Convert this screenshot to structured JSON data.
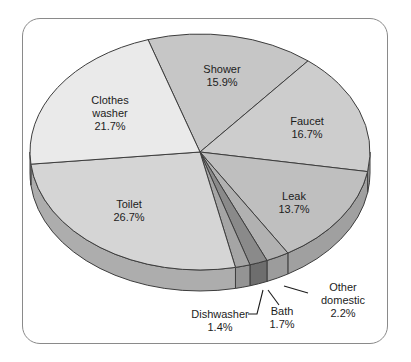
{
  "frame": {
    "background_color": "#ffffff",
    "border_color": "#8a8a8a"
  },
  "chart_data": {
    "type": "pie",
    "title": "",
    "style": "3d-pie-grayscale",
    "direction": "clockwise",
    "start_angle_deg": 107.8,
    "outline_color": "#3d3d3d",
    "label_color": "#1c1c1c",
    "categories": [
      "Shower",
      "Faucet",
      "Leak",
      "Other domestic",
      "Bath",
      "Dishwasher",
      "Toilet",
      "Clothes washer"
    ],
    "values": [
      15.9,
      16.7,
      13.7,
      2.2,
      1.7,
      1.4,
      26.7,
      21.7
    ],
    "slices": [
      {
        "id": "shower",
        "label": "Shower",
        "value": 15.9,
        "display": "15.9%",
        "top_color": "#c6c6c6",
        "side_color": "#a8a8a8",
        "label_lines": "Shower\n15.9%",
        "label_pos": [
          222,
          76
        ]
      },
      {
        "id": "faucet",
        "label": "Faucet",
        "value": 16.7,
        "display": "16.7%",
        "top_color": "#cdcdcd",
        "side_color": "#a4a4a4",
        "label_lines": "Faucet\n16.7%",
        "label_pos": [
          307,
          128
        ]
      },
      {
        "id": "leak",
        "label": "Leak",
        "value": 13.7,
        "display": "13.7%",
        "top_color": "#bfbfbf",
        "side_color": "#a0a0a0",
        "label_lines": "Leak\n13.7%",
        "label_pos": [
          294,
          203
        ]
      },
      {
        "id": "other-domestic",
        "label": "Other domestic",
        "value": 2.2,
        "display": "2.2%",
        "top_color": "#b1b1b1",
        "side_color": "#9c9c9c",
        "label_lines": "Other domestic\n2.2%",
        "label_pos": [
          343,
          300
        ],
        "leader": [
          [
            308,
            293
          ],
          [
            284,
            286
          ]
        ]
      },
      {
        "id": "bath",
        "label": "Bath",
        "value": 1.7,
        "display": "1.7%",
        "top_color": "#8a8a8a",
        "side_color": "#6e6e6e",
        "label_lines": "Bath\n1.7%",
        "label_pos": [
          282,
          318
        ],
        "leader": [
          [
            279,
            305
          ],
          [
            268,
            290
          ]
        ]
      },
      {
        "id": "dishwasher",
        "label": "Dishwasher",
        "value": 1.4,
        "display": "1.4%",
        "top_color": "#a5a5a5",
        "side_color": "#949494",
        "label_lines": "Dishwasher\n1.4%",
        "label_pos": [
          220,
          321
        ],
        "leader": [
          [
            248,
            314
          ],
          [
            257,
            314
          ],
          [
            263,
            290
          ]
        ]
      },
      {
        "id": "toilet",
        "label": "Toilet",
        "value": 26.7,
        "display": "26.7%",
        "top_color": "#d5d5d5",
        "side_color": "#adadad",
        "label_lines": "Toilet\n26.7%",
        "label_pos": [
          129,
          211
        ]
      },
      {
        "id": "clothes-washer",
        "label": "Clothes washer",
        "value": 21.7,
        "display": "21.7%",
        "top_color": "#eaeaea",
        "side_color": "#bcbcbc",
        "label_lines": "Clothes\nwasher\n21.7%",
        "label_pos": [
          110,
          113
        ]
      }
    ]
  }
}
